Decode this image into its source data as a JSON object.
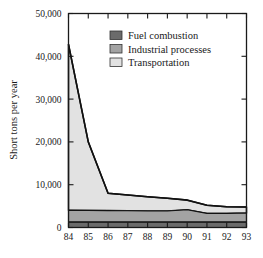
{
  "chart_data": {
    "type": "area",
    "title": "",
    "subtitle": "",
    "xlabel": "",
    "ylabel": "Short tons per year",
    "stacked": true,
    "grid": false,
    "legend_position": "top-center",
    "categories": [
      "84",
      "85",
      "86",
      "87",
      "88",
      "89",
      "90",
      "91",
      "92",
      "93"
    ],
    "x": [
      1984,
      1985,
      1986,
      1987,
      1988,
      1989,
      1990,
      1991,
      1992,
      1993
    ],
    "xlim": [
      1984,
      1993
    ],
    "ylim": [
      0,
      50000
    ],
    "yticks": [
      0,
      10000,
      20000,
      30000,
      40000,
      50000
    ],
    "ytick_labels": [
      "0",
      "10,000",
      "20,000",
      "30,000",
      "40,000",
      "50,000"
    ],
    "xtick_labels": [
      "84",
      "85",
      "86",
      "87",
      "88",
      "89",
      "90",
      "91",
      "92",
      "93"
    ],
    "series": [
      {
        "name": "Fuel combustion",
        "color": "#6b6b6b",
        "values": [
          1250,
          1250,
          1250,
          1250,
          1250,
          1250,
          1250,
          1250,
          1250,
          1250
        ]
      },
      {
        "name": "Industrial processes",
        "color": "#a3a3a3",
        "values": [
          2800,
          2750,
          2700,
          2650,
          2600,
          2600,
          2900,
          2050,
          2050,
          2150
        ]
      },
      {
        "name": "Transportation",
        "color": "#e2e2e2",
        "values": [
          38750,
          16000,
          4050,
          3700,
          3350,
          3000,
          2250,
          1900,
          1550,
          1400
        ]
      }
    ],
    "totals": [
      42800,
      20000,
      8000,
      7600,
      7200,
      6850,
      6400,
      5200,
      4850,
      4800
    ]
  },
  "axes": {
    "y_axis_title": "Short tons per year",
    "y_tick_labels": [
      "50,000",
      "40,000",
      "30,000",
      "20,000",
      "10,000",
      "0"
    ],
    "x_tick_labels": [
      "84",
      "85",
      "86",
      "87",
      "88",
      "89",
      "90",
      "91",
      "92",
      "93"
    ]
  },
  "legend": {
    "items": [
      {
        "label": "Fuel combustion",
        "swatch_color": "#6b6b6b"
      },
      {
        "label": "Industrial processes",
        "swatch_color": "#a3a3a3"
      },
      {
        "label": "Transportation",
        "swatch_color": "#e2e2e2"
      }
    ]
  },
  "style": {
    "background": "#ffffff",
    "axis_color": "#1a1a1a",
    "series_outline": "#111111"
  }
}
